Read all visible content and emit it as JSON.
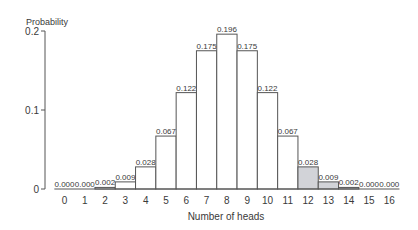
{
  "chart_data": {
    "type": "bar",
    "title": "",
    "xlabel": "Number of heads",
    "ylabel": "Probability",
    "ylim": [
      0,
      0.2
    ],
    "yticks": [
      0,
      0.1,
      0.2
    ],
    "ytick_labels": [
      "0",
      "0.1",
      "0.2"
    ],
    "grid": false,
    "legend": null,
    "categories": [
      "0",
      "1",
      "2",
      "3",
      "4",
      "5",
      "6",
      "7",
      "8",
      "9",
      "10",
      "11",
      "12",
      "13",
      "14",
      "15",
      "16"
    ],
    "values": [
      0.0,
      0.0,
      0.002,
      0.009,
      0.028,
      0.067,
      0.122,
      0.175,
      0.196,
      0.175,
      0.122,
      0.067,
      0.028,
      0.009,
      0.002,
      0.0,
      0.0
    ],
    "value_labels": [
      "0.000",
      "0.000",
      "0.002",
      "0.009",
      "0.028",
      "0.067",
      "0.122",
      "0.175",
      "0.196",
      "0.175",
      "0.122",
      "0.067",
      "0.028",
      "0.009",
      "0.002",
      "0.000",
      "0.000"
    ],
    "highlighted": [
      false,
      false,
      false,
      false,
      false,
      false,
      false,
      false,
      false,
      false,
      false,
      false,
      true,
      true,
      true,
      true,
      true
    ],
    "colors": {
      "bar": "#ffffff",
      "highlight": "#d2d3d8",
      "stroke": "#555555",
      "text": "#3a3a3a"
    }
  }
}
